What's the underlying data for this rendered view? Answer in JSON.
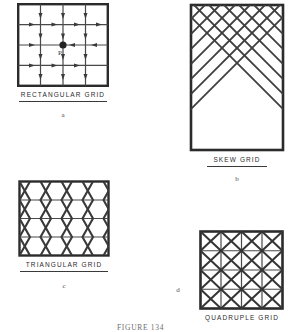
{
  "figure": {
    "caption": "FIGURE 134",
    "caption_x": 117,
    "caption_y": 320
  },
  "panels": [
    {
      "id": "rectangular-grid",
      "label": "RECTANGULAR   GRID",
      "sublabel": "a",
      "point_label": "P",
      "type": "rectangular",
      "cols": 4,
      "rows": 4,
      "box": {
        "x": 17,
        "y": 3,
        "w": 92,
        "h": 84
      },
      "caption_pos": {
        "x": 17,
        "y": 92,
        "w": 92
      },
      "rule_pos": {
        "x": 19,
        "y": 101,
        "w": 88
      },
      "sublabel_pos": {
        "x": 17,
        "y": 112,
        "w": 92
      },
      "has_arrows": true,
      "point": {
        "col": 2,
        "row": 2
      }
    },
    {
      "id": "skew-grid",
      "label": "SKEW   GRID",
      "sublabel": "b",
      "type": "skew",
      "cols": 6,
      "rows": 10,
      "box": {
        "x": 189,
        "y": 3,
        "w": 96,
        "h": 149
      },
      "caption_pos": {
        "x": 189,
        "y": 157,
        "w": 96
      },
      "rule_pos": {
        "x": 207,
        "y": 166,
        "w": 60
      },
      "sublabel_pos": {
        "x": 189,
        "y": 176,
        "w": 96
      },
      "has_arrows": false
    },
    {
      "id": "triangular-grid",
      "label": "TRIANGULAR   GRID",
      "sublabel": "c",
      "type": "triangular",
      "cols": 5,
      "rows": 4,
      "box": {
        "x": 18,
        "y": 180,
        "w": 92,
        "h": 77
      },
      "caption_pos": {
        "x": 18,
        "y": 262,
        "w": 92
      },
      "rule_pos": {
        "x": 20,
        "y": 271,
        "w": 88
      },
      "sublabel_pos": {
        "x": 18,
        "y": 283,
        "w": 92
      },
      "has_arrows": false
    },
    {
      "id": "quadruple-grid",
      "label": "QUADRUPLE   GRID",
      "sublabel": "d",
      "type": "quadruple",
      "cols": 4,
      "rows": 4,
      "box": {
        "x": 199,
        "y": 230,
        "w": 85,
        "h": 80
      },
      "caption_pos": {
        "x": 196,
        "y": 315,
        "w": 92
      },
      "rule_pos": {
        "x": 0,
        "y": 0,
        "w": 0
      },
      "sublabel_pos": {
        "x": 173,
        "y": 287,
        "w": 10
      },
      "has_arrows": false
    }
  ],
  "colors": {
    "ink": "#1a1a1a",
    "ink_light": "#3f3f3f",
    "paper": "#ffffff",
    "caption": "#2b2b2b"
  }
}
